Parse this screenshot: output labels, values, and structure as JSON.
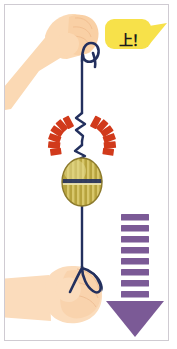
{
  "panel": {
    "width": 177,
    "height": 349,
    "background_color": "#ffffff",
    "border_color": "#cfcbd2",
    "title": "Spinning top pull-string illustration"
  },
  "speech_bubble": {
    "text": "上！",
    "fill_color": "#f7e14a",
    "text_color": "#1c1c1c",
    "tail_direction": "right"
  },
  "hands": {
    "upper": {
      "label": "upper-hand-holding-string",
      "skin_color": "#fbd9b4",
      "skin_shadow_color": "#f6c99b"
    },
    "lower": {
      "label": "lower-fist",
      "skin_color": "#fbdcbc",
      "skin_shadow_color": "#f7cda5"
    }
  },
  "string": {
    "label": "pull-string",
    "color": "#23305e",
    "squiggle_count": 2,
    "top_loop": "hook-loop",
    "bottom_loop": "finger-loop"
  },
  "spool": {
    "label": "spinning-top",
    "body_color": "#b7a33e",
    "stripe_color": "#d6c463",
    "outline_color": "#23305e",
    "highlight_color": "#e4d88c"
  },
  "burst": {
    "label": "impact-burst",
    "ray_color": "#d13a1b",
    "ray_count": 12
  },
  "arrow": {
    "label": "downward-motion-arrow",
    "color": "#7b5a96",
    "direction": "down",
    "dash_count": 8,
    "head_shape": "triangle"
  }
}
